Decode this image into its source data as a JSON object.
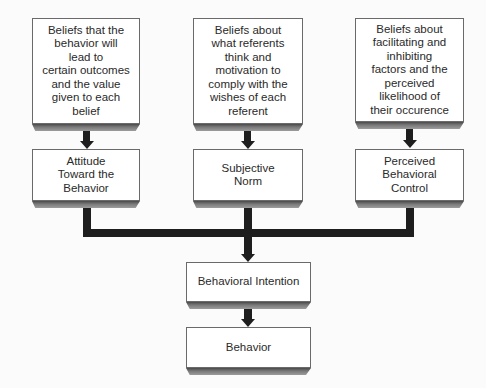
{
  "diagram": {
    "belief_boxes": [
      {
        "id": "behavioral-beliefs",
        "text": "Beliefs that the\nbehavior will\nlead to\ncertain outcomes\nand the value\ngiven to each\nbelief"
      },
      {
        "id": "normative-beliefs",
        "text": "Beliefs about\nwhat referents\nthink and\nmotivation to\ncomply with the\nwishes of each\nreferent"
      },
      {
        "id": "control-beliefs",
        "text": "Beliefs about\nfacilitating and\ninhibiting\nfactors and the\nperceived\nlikelihood of\ntheir occurence"
      }
    ],
    "construct_boxes": [
      {
        "id": "attitude",
        "text": "Attitude\nToward the\nBehavior"
      },
      {
        "id": "subjective-norm",
        "text": "Subjective\nNorm"
      },
      {
        "id": "perceived-behavioral-control",
        "text": "Perceived\nBehavioral\nControl"
      }
    ],
    "intention_box": {
      "id": "behavioral-intention",
      "text": "Behavioral Intention"
    },
    "behavior_box": {
      "id": "behavior",
      "text": "Behavior"
    },
    "edges": [
      {
        "from": "behavioral-beliefs",
        "to": "attitude"
      },
      {
        "from": "normative-beliefs",
        "to": "subjective-norm"
      },
      {
        "from": "control-beliefs",
        "to": "perceived-behavioral-control"
      },
      {
        "from": "attitude",
        "to": "behavioral-intention"
      },
      {
        "from": "subjective-norm",
        "to": "behavioral-intention"
      },
      {
        "from": "perceived-behavioral-control",
        "to": "behavioral-intention"
      },
      {
        "from": "behavioral-intention",
        "to": "behavior"
      }
    ],
    "colors": {
      "box_fill": "#ffffff",
      "box_border": "#6a6a6a",
      "connector": "#1e1e1e",
      "shadow": "#4a4a4a",
      "text": "#2a2a2a"
    }
  }
}
